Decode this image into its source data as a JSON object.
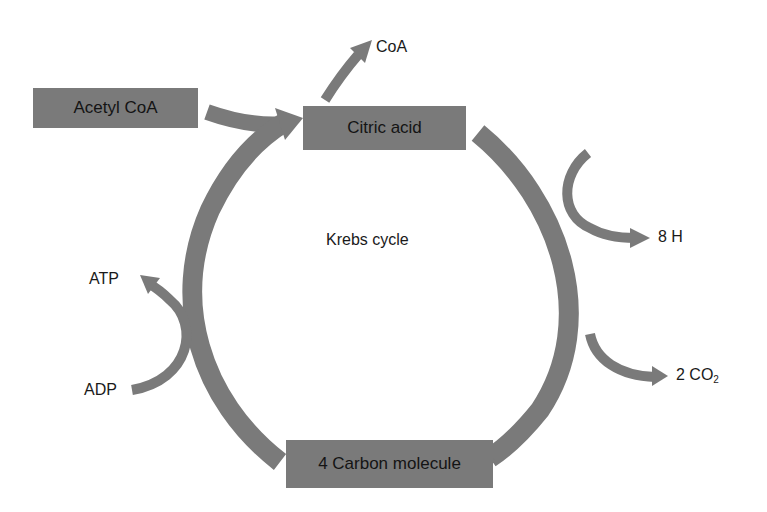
{
  "diagram": {
    "title": "Krebs cycle",
    "colors": {
      "box_fill": "#7a7a7a",
      "arrow_fill": "#7a7a7a",
      "text": "#1a1a1a",
      "background": "#ffffff"
    },
    "nodes": {
      "acetyl_coa": "Acetyl CoA",
      "citric_acid": "Citric acid",
      "four_carbon": "4 Carbon molecule"
    },
    "labels": {
      "coa": "CoA",
      "eight_h": "8 H",
      "two_co2_prefix": "2 CO",
      "two_co2_sub": "2",
      "atp": "ATP",
      "adp": "ADP",
      "center": "Krebs cycle"
    },
    "edges": [
      {
        "from": "Acetyl CoA",
        "to": "Citric acid"
      },
      {
        "from": "Citric acid",
        "to": "CoA"
      },
      {
        "from": "Citric acid",
        "to": "4 Carbon molecule",
        "releases": [
          "8 H",
          "2 CO2"
        ]
      },
      {
        "from": "4 Carbon molecule",
        "to": "Citric acid",
        "side_reaction": "ADP → ATP"
      }
    ]
  }
}
